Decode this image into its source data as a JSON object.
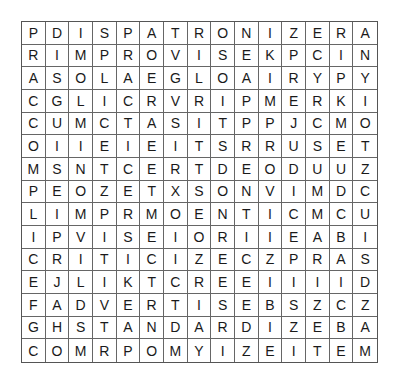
{
  "puzzle": {
    "rows": [
      "PDISPATRONIZERA",
      "RIMPROVISEKPCIN",
      "ASOLAEGLOAIRYPY",
      "CGLICRVRIPMERKI",
      "CUMCTASITPPJCMO",
      "OIIEIEITSRRUSET",
      "MSNTCERTDEODUUZ",
      "PEOZETXSONVIMDC",
      "LIMPRMOENTICMCU",
      "IPVISEIORIIEABI",
      "CRITICIZECZPRAS",
      "EJLIKTCREEIIIID",
      "FADVERTISEBSZCZ",
      "GHSTANDARDIZEBA",
      "COMRPOMYIZEITEM"
    ]
  }
}
